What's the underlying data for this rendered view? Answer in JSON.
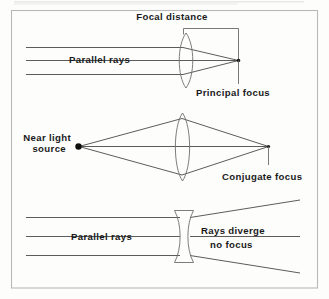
{
  "figure": {
    "background_color": "#fdfdfc",
    "frame_color": "#b9b9b9",
    "ray_color": "#4a4a4a",
    "lens_color": "#6e6e6e",
    "text_color": "#1a1a1a"
  },
  "panels": [
    {
      "id": "convex-parallel",
      "lens_type": "biconvex",
      "labels": {
        "focal_distance": "Focal distance",
        "parallel_rays": "Parallel rays",
        "principal_focus": "Principal focus"
      },
      "ray_count": 3
    },
    {
      "id": "convex-near-source",
      "lens_type": "biconvex",
      "labels": {
        "near_light_line1": "Near light",
        "near_light_line2": "source",
        "conjugate_focus": "Conjugate focus"
      },
      "ray_count": 3
    },
    {
      "id": "concave-parallel",
      "lens_type": "biconcave",
      "labels": {
        "parallel_rays": "Parallel rays",
        "rays_diverge_line1": "Rays diverge",
        "rays_diverge_line2": "no focus"
      },
      "ray_count": 3
    }
  ]
}
